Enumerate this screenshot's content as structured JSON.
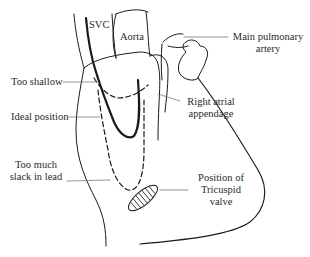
{
  "diagram": {
    "type": "anatomical line drawing",
    "structures": {
      "svc": "SVC",
      "aorta": "Aorta",
      "pulmonary_artery_line1": "Main pulmonary",
      "pulmonary_artery_line2": "artery",
      "appendage_line1": "Right atrial",
      "appendage_line2": "appendage",
      "valve_line1": "Position of",
      "valve_line2": "Tricuspid",
      "valve_line3": "valve"
    },
    "lead_positions": {
      "shallow": "Too shallow",
      "ideal": "Ideal position",
      "slack_line1": "Too much",
      "slack_line2": "slack in lead"
    },
    "colors": {
      "line": "#1a1a1a",
      "leader": "#7a7a7a"
    }
  }
}
